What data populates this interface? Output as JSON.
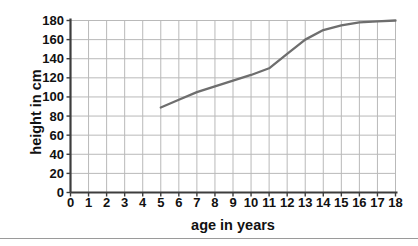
{
  "chart_data": {
    "type": "line",
    "title": "",
    "xlabel": "age in years",
    "ylabel": "height in cm",
    "xlim": [
      0,
      18
    ],
    "ylim": [
      0,
      180
    ],
    "xticks": [
      "0",
      "1",
      "2",
      "3",
      "4",
      "5",
      "6",
      "7",
      "8",
      "9",
      "10",
      "11",
      "12",
      "13",
      "14",
      "15",
      "16",
      "17",
      "18"
    ],
    "yticks": [
      "0",
      "20",
      "40",
      "60",
      "80",
      "100",
      "120",
      "140",
      "160",
      "180"
    ],
    "grid": true,
    "legend": "none",
    "series": [
      {
        "name": "height",
        "color": "#6e6e6e",
        "x": [
          5,
          6,
          7,
          8,
          9,
          10,
          11,
          12,
          13,
          14,
          15,
          16,
          17,
          18
        ],
        "values": [
          89,
          97,
          105,
          111,
          117,
          123,
          130,
          145,
          160,
          170,
          175,
          178,
          179,
          180
        ]
      }
    ]
  },
  "axes": {
    "axis_color": "#3d3d3d",
    "grid_color": "#b9b9b9",
    "tick_color": "#3d3d3d",
    "text_color": "#111111"
  },
  "page": {
    "background": "#ffffff",
    "rule_color": "#9a9a9a"
  }
}
